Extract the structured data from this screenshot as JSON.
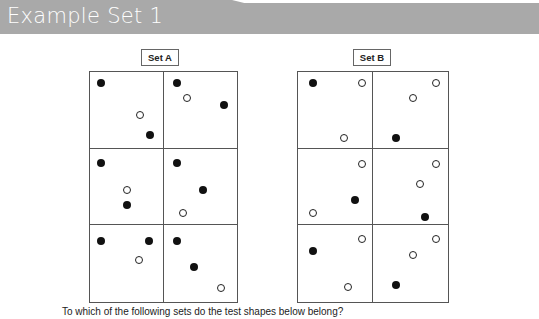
{
  "header": {
    "title": "Example Set 1",
    "band_color": "#a9a9a9"
  },
  "sets": [
    {
      "label": "Set A",
      "cells": [
        {
          "row": 0,
          "col": 0,
          "dots": [
            {
              "type": "filled",
              "x": 11,
              "y": 11
            },
            {
              "type": "hollow",
              "x": 50,
              "y": 43
            },
            {
              "type": "filled",
              "x": 60,
              "y": 63
            }
          ]
        },
        {
          "row": 0,
          "col": 1,
          "dots": [
            {
              "type": "filled",
              "x": 13,
              "y": 11
            },
            {
              "type": "hollow",
              "x": 23,
              "y": 26
            },
            {
              "type": "filled",
              "x": 60,
              "y": 33
            }
          ]
        },
        {
          "row": 1,
          "col": 0,
          "dots": [
            {
              "type": "filled",
              "x": 11,
              "y": 14
            },
            {
              "type": "hollow",
              "x": 37,
              "y": 41
            },
            {
              "type": "filled",
              "x": 37,
              "y": 56
            }
          ]
        },
        {
          "row": 1,
          "col": 1,
          "dots": [
            {
              "type": "filled",
              "x": 13,
              "y": 14
            },
            {
              "type": "filled",
              "x": 39,
              "y": 41
            },
            {
              "type": "hollow",
              "x": 19,
              "y": 64
            }
          ]
        },
        {
          "row": 2,
          "col": 0,
          "dots": [
            {
              "type": "filled",
              "x": 11,
              "y": 16
            },
            {
              "type": "filled",
              "x": 59,
              "y": 16
            },
            {
              "type": "hollow",
              "x": 49,
              "y": 35
            }
          ]
        },
        {
          "row": 2,
          "col": 1,
          "dots": [
            {
              "type": "filled",
              "x": 13,
              "y": 16
            },
            {
              "type": "filled",
              "x": 30,
              "y": 42
            },
            {
              "type": "hollow",
              "x": 57,
              "y": 63
            }
          ]
        }
      ]
    },
    {
      "label": "Set B",
      "cells": [
        {
          "row": 0,
          "col": 0,
          "dots": [
            {
              "type": "filled",
              "x": 15,
              "y": 11
            },
            {
              "type": "hollow",
              "x": 64,
              "y": 11
            },
            {
              "type": "hollow",
              "x": 46,
              "y": 66
            }
          ]
        },
        {
          "row": 0,
          "col": 1,
          "dots": [
            {
              "type": "hollow",
              "x": 63,
              "y": 11
            },
            {
              "type": "hollow",
              "x": 40,
              "y": 26
            },
            {
              "type": "filled",
              "x": 23,
              "y": 66
            }
          ]
        },
        {
          "row": 1,
          "col": 0,
          "dots": [
            {
              "type": "hollow",
              "x": 64,
              "y": 15
            },
            {
              "type": "filled",
              "x": 57,
              "y": 51
            },
            {
              "type": "hollow",
              "x": 15,
              "y": 64
            }
          ]
        },
        {
          "row": 1,
          "col": 1,
          "dots": [
            {
              "type": "hollow",
              "x": 63,
              "y": 15
            },
            {
              "type": "hollow",
              "x": 47,
              "y": 35
            },
            {
              "type": "filled",
              "x": 52,
              "y": 68
            }
          ]
        },
        {
          "row": 2,
          "col": 0,
          "dots": [
            {
              "type": "hollow",
              "x": 64,
              "y": 14
            },
            {
              "type": "filled",
              "x": 15,
              "y": 26
            },
            {
              "type": "hollow",
              "x": 50,
              "y": 62
            }
          ]
        },
        {
          "row": 2,
          "col": 1,
          "dots": [
            {
              "type": "hollow",
              "x": 63,
              "y": 14
            },
            {
              "type": "hollow",
              "x": 40,
              "y": 30
            },
            {
              "type": "filled",
              "x": 23,
              "y": 60
            }
          ]
        }
      ]
    }
  ],
  "question": "To which of the following sets do the test shapes below belong?"
}
